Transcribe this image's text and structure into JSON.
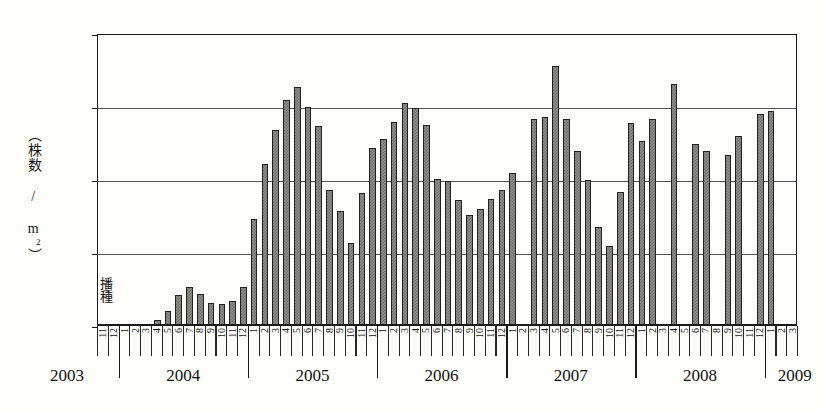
{
  "chart": {
    "type": "bar",
    "y_axis_label": "（株数 / m2）",
    "y_axis_label_plain": "（株数 / m²）",
    "annotation": "播種",
    "y_ticks": [
      0,
      50,
      100,
      150,
      200
    ],
    "ylim": [
      0,
      200
    ],
    "grid": "horizontal",
    "bar_color": "#8e8d88",
    "bar_edge_color": "#23211e",
    "year_labels": [
      "2003",
      "2004",
      "2005",
      "2006",
      "2007",
      "2008",
      "2009"
    ]
  },
  "chart_data": {
    "type": "bar",
    "title": "",
    "xlabel": "",
    "ylabel": "（株数 / m²）",
    "ylim": [
      0,
      200
    ],
    "grid": true,
    "legend": "none",
    "annotations": [
      {
        "text": "播種",
        "x": "2003-11",
        "orientation": "vertical"
      }
    ],
    "categories": [
      "2003-11",
      "2003-12",
      "2004-1",
      "2004-2",
      "2004-3",
      "2004-4",
      "2004-5",
      "2004-6",
      "2004-7",
      "2004-8",
      "2004-9",
      "2004-10",
      "2004-11",
      "2004-12",
      "2005-1",
      "2005-2",
      "2005-3",
      "2005-4",
      "2005-5",
      "2005-6",
      "2005-7",
      "2005-8",
      "2005-9",
      "2005-10",
      "2005-11",
      "2005-12",
      "2006-1",
      "2006-2",
      "2006-3",
      "2006-4",
      "2006-5",
      "2006-6",
      "2006-7",
      "2006-8",
      "2006-9",
      "2006-10",
      "2006-11",
      "2006-12",
      "2007-1",
      "2007-2",
      "2007-3",
      "2007-4",
      "2007-5",
      "2007-6",
      "2007-7",
      "2007-8",
      "2007-9",
      "2007-10",
      "2007-11",
      "2007-12",
      "2008-1",
      "2008-2",
      "2008-3",
      "2008-4",
      "2008-5",
      "2008-6",
      "2008-7",
      "2008-8",
      "2008-9",
      "2008-10",
      "2008-11",
      "2008-12",
      "2009-1",
      "2009-2",
      "2009-3"
    ],
    "month_tick_labels": [
      "11",
      "12",
      "1",
      "2",
      "3",
      "4",
      "5",
      "6",
      "7",
      "8",
      "9",
      "10",
      "11",
      "12",
      "1",
      "2",
      "3",
      "4",
      "5",
      "6",
      "7",
      "8",
      "9",
      "10",
      "11",
      "12",
      "1",
      "2",
      "3",
      "4",
      "5",
      "6",
      "7",
      "8",
      "9",
      "10",
      "11",
      "12",
      "1",
      "2",
      "3",
      "4",
      "5",
      "6",
      "7",
      "8",
      "9",
      "10",
      "11",
      "12",
      "1",
      "2",
      "3",
      "4",
      "5",
      "6",
      "7",
      "8",
      "9",
      "10",
      "11",
      "12",
      "1",
      "2",
      "3"
    ],
    "values": [
      0,
      0,
      1,
      1,
      1,
      4,
      10,
      21,
      27,
      22,
      16,
      15,
      17,
      27,
      73,
      111,
      134,
      155,
      164,
      150,
      137,
      93,
      79,
      57,
      91,
      122,
      128,
      140,
      153,
      149,
      138,
      101,
      99,
      86,
      76,
      80,
      87,
      93,
      105,
      null,
      142,
      143,
      178,
      142,
      120,
      100,
      68,
      55,
      92,
      139,
      127,
      142,
      null,
      166,
      null,
      125,
      120,
      null,
      117,
      130,
      null,
      145,
      147,
      null,
      null
    ],
    "missing_months": [
      "2007-2",
      "2008-3",
      "2008-5",
      "2008-8",
      "2008-11",
      "2009-2",
      "2009-3"
    ]
  }
}
